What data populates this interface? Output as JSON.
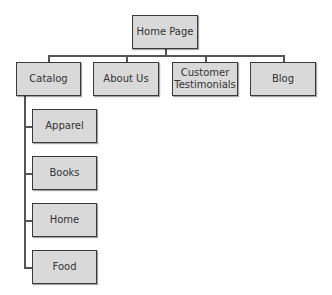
{
  "diagram": {
    "type": "sitemap",
    "root": {
      "label": "Home Page"
    },
    "level1": [
      {
        "label": "Catalog"
      },
      {
        "label": "About Us"
      },
      {
        "label": "Customer Testimonials"
      },
      {
        "label": "Blog"
      }
    ],
    "catalog_children": [
      {
        "label": "Apparel"
      },
      {
        "label": "Books"
      },
      {
        "label": "Home"
      },
      {
        "label": "Food"
      }
    ],
    "colors": {
      "box_fill": "#d9d9d9",
      "box_border": "#3a3a3a",
      "connector": "#555555"
    }
  }
}
